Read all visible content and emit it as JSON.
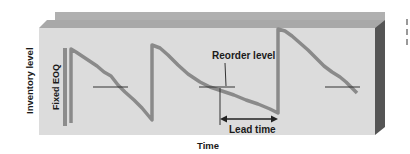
{
  "diagram": {
    "type": "inventory-sawtooth",
    "labels": {
      "y_axis": "Inventory level",
      "x_axis": "Time",
      "eoq": "Fixed EOQ",
      "reorder": "Reorder level",
      "lead_time": "Lead time"
    },
    "colors": {
      "panel_face": "#d9d9d9",
      "panel_back": "#b8b8b8",
      "panel_top": "#a9a9a9",
      "panel_side": "#5a5a5a",
      "curve": "#8c8c8c",
      "reorder_line": "#333333",
      "text": "#1a1a1a"
    },
    "cycles": 3
  }
}
